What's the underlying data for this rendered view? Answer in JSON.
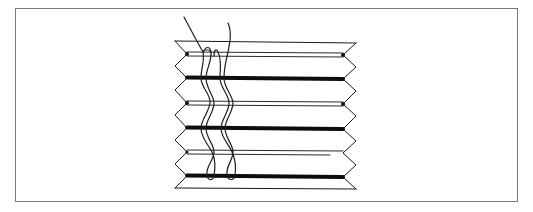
{
  "figure": {
    "frame_color": "#7a7a7a",
    "line_color": "#1a1a1a"
  },
  "pleats": {
    "left_outer_x": 175,
    "left_inner_x": 187,
    "right_outer_x": 356,
    "right_inner_x": 343,
    "rows": [
      {
        "type": "edge-top",
        "y": 42
      },
      {
        "type": "double",
        "y": 54
      },
      {
        "type": "thick",
        "y": 78
      },
      {
        "type": "double",
        "y": 103
      },
      {
        "type": "thick",
        "y": 128
      },
      {
        "type": "double",
        "y": 152
      },
      {
        "type": "thick",
        "y": 176
      },
      {
        "type": "edge-bottom",
        "y": 188
      }
    ]
  },
  "cords": [
    {
      "name": "left-cord",
      "loop_x": 210
    },
    {
      "name": "right-cord",
      "loop_x": 231
    }
  ]
}
